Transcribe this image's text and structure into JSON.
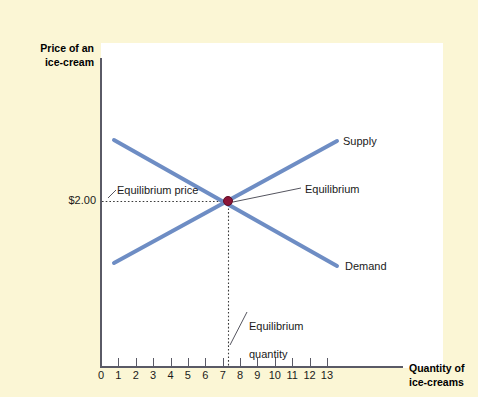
{
  "figure": {
    "background_color": "#FBF6D5",
    "plot_background_color": "#FFFFFF",
    "axis_color": "#5A5A66",
    "curve_color": "#6E8DC4",
    "equilibrium_dot_color": "#8C1538",
    "leader_line_color": "#55555F"
  },
  "axes": {
    "y_title_line1": "Price of an",
    "y_title_line2": "ice-cream",
    "x_title_line1": "Quantity of",
    "x_title_line2": "ice-creams",
    "x_ticks": [
      "0",
      "1",
      "2",
      "3",
      "4",
      "5",
      "6",
      "7",
      "8",
      "9",
      "10",
      "11",
      "12",
      "13"
    ],
    "y_value_label": "$2.00"
  },
  "annotations": {
    "equilibrium_price": "Equilibrium price",
    "equilibrium": "Equilibrium",
    "equilibrium_quantity_line1": "Equilibrium",
    "equilibrium_quantity_line2": "quantity",
    "supply": "Supply",
    "demand": "Demand"
  },
  "chart_data": {
    "type": "line",
    "title": "",
    "xlabel": "Quantity of ice-creams",
    "ylabel": "Price of an ice-cream",
    "xlim": [
      0,
      13
    ],
    "ylim": [
      0,
      5
    ],
    "grid": false,
    "legend": "inline-labels",
    "series": [
      {
        "name": "Supply",
        "color": "#6E8DC4",
        "points": [
          {
            "x": 0.75,
            "y": 1.35
          },
          {
            "x": 13.6,
            "y": 3.5
          }
        ],
        "label_position": "upper-right"
      },
      {
        "name": "Demand",
        "color": "#6E8DC4",
        "points": [
          {
            "x": 0.75,
            "y": 3.5
          },
          {
            "x": 13.6,
            "y": 1.47
          }
        ],
        "label_position": "lower-right"
      }
    ],
    "equilibrium": {
      "quantity": 7,
      "price": 2.0,
      "price_display": "$2.00",
      "marker_color": "#8C1538"
    },
    "guide_lines": [
      {
        "type": "horizontal-dotted",
        "from_x": 0,
        "to_x": 7,
        "y": 2.0
      },
      {
        "type": "vertical-dotted",
        "x": 7,
        "from_y": 0,
        "to_y": 2.0
      }
    ]
  }
}
